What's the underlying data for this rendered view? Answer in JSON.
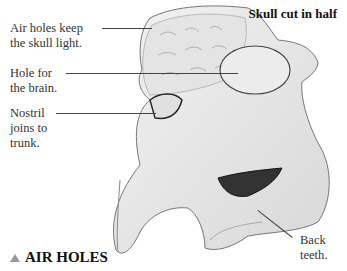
{
  "title": "Skull cut in half",
  "labels": {
    "air_holes": [
      "Air holes keep",
      "the skull light."
    ],
    "brain_hole": [
      "Hole for",
      "the brain."
    ],
    "nostril": [
      "Nostril",
      "joins to",
      "trunk."
    ],
    "back_teeth": [
      "Back",
      "teeth."
    ]
  },
  "heading": {
    "text": "AIR HOLES",
    "icon": "triangle-up-icon",
    "icon_color": "#999999"
  }
}
